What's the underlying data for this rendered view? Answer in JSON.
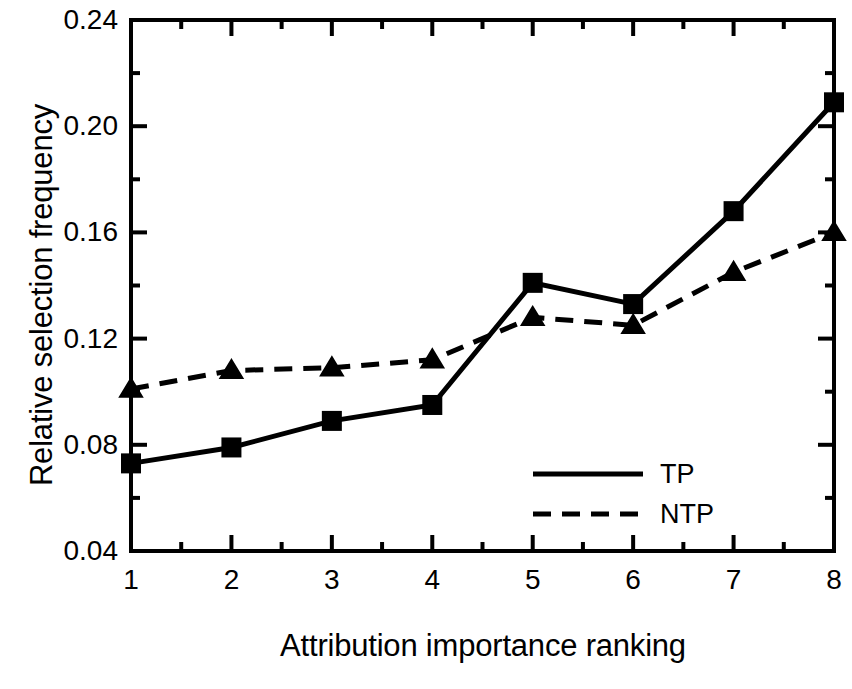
{
  "chart_data": {
    "type": "line",
    "title": "",
    "xlabel": "Attribution importance ranking",
    "ylabel": "Relative selection frequency",
    "x": [
      1,
      2,
      3,
      4,
      5,
      6,
      7,
      8
    ],
    "xticklabels": [
      "1",
      "2",
      "3",
      "4",
      "5",
      "6",
      "7",
      "8"
    ],
    "yticklabels": [
      "0.24",
      "0.20",
      "0.16",
      "0.12",
      "0.08",
      "0.04"
    ],
    "ytickvalues": [
      0.24,
      0.2,
      0.16,
      0.12,
      0.08,
      0.04
    ],
    "xlim": [
      1,
      8
    ],
    "ylim": [
      0.04,
      0.24
    ],
    "grid": false,
    "minor_ticks": true,
    "legend_position": "lower right",
    "series": [
      {
        "name": "TP",
        "linestyle": "solid",
        "marker": "square",
        "color": "#000000",
        "values": [
          0.073,
          0.079,
          0.089,
          0.095,
          0.141,
          0.133,
          0.168,
          0.209
        ]
      },
      {
        "name": "NTP",
        "linestyle": "dashed",
        "marker": "triangle",
        "color": "#000000",
        "values": [
          0.101,
          0.108,
          0.109,
          0.112,
          0.128,
          0.125,
          0.145,
          0.16
        ]
      }
    ]
  },
  "legend": {
    "entries": [
      {
        "label": "TP",
        "style": "solid"
      },
      {
        "label": "NTP",
        "style": "dashed"
      }
    ]
  },
  "colors": {
    "background": "#ffffff",
    "ink": "#000000"
  }
}
